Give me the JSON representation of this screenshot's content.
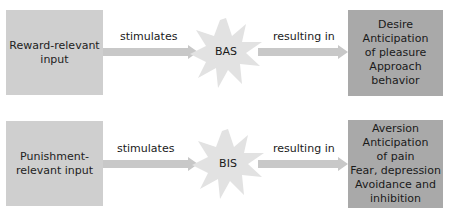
{
  "colors": {
    "input_box": "#cfcfcf",
    "output_box": "#a9a9a9",
    "arrow": "#c8c8c8",
    "star": "#e2e2e2"
  },
  "rows": [
    {
      "input": [
        "Reward-relevant",
        "input"
      ],
      "arrow1_label": "stimulates",
      "system": "BAS",
      "arrow2_label": "resulting in",
      "output": [
        "Desire",
        "Anticipation",
        "of pleasure",
        "Approach",
        "behavior"
      ]
    },
    {
      "input": [
        "Punishment-",
        "relevant input"
      ],
      "arrow1_label": "stimulates",
      "system": "BIS",
      "arrow2_label": "resulting in",
      "output": [
        "Aversion",
        "Anticipation",
        "of pain",
        "Fear, depression",
        "Avoidance and",
        "inhibition"
      ]
    }
  ]
}
